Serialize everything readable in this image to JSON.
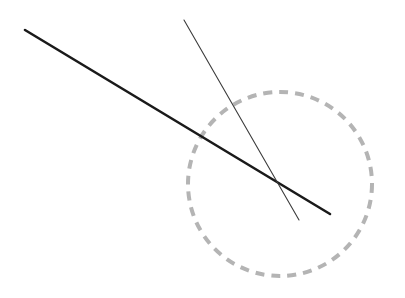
{
  "figure": {
    "background_color": "#ffffff",
    "width": 405,
    "height": 298
  },
  "chart_data": {
    "type": "scatter",
    "title": "",
    "xlabel": "",
    "ylabel": "",
    "grid": false,
    "legend": "none",
    "xlim": [
      0,
      405
    ],
    "ylim": [
      0,
      298
    ],
    "shapes": [
      {
        "name": "thick-line",
        "type": "line",
        "x1": 25,
        "y1": 30,
        "x2": 330,
        "y2": 214,
        "color": "#1a1a1a",
        "stroke_width": 2.6,
        "style": "solid"
      },
      {
        "name": "thin-line",
        "type": "line",
        "x1": 184,
        "y1": 20,
        "x2": 299,
        "y2": 220,
        "color": "#3c3c3c",
        "stroke_width": 1.1,
        "style": "solid"
      },
      {
        "name": "dashed-circle",
        "type": "circle",
        "cx": 280,
        "cy": 184,
        "r": 92,
        "color": "#b4b4b4",
        "stroke_width": 4,
        "style": "dashed",
        "dash_length": 9,
        "dash_gap": 7
      }
    ],
    "points": [
      {
        "name": "intersection",
        "x": 279,
        "y": 184,
        "label": ""
      }
    ]
  }
}
